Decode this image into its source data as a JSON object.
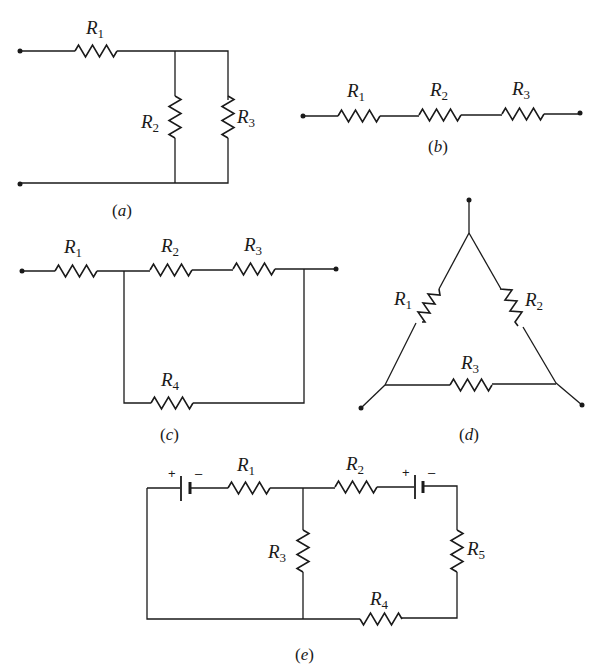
{
  "figure": {
    "circuits": [
      {
        "id": "a",
        "caption_letter": "a",
        "topology": "R1 in series with parallel combination of R2 and R3",
        "resistors": [
          {
            "name": "R",
            "sub": "1"
          },
          {
            "name": "R",
            "sub": "2"
          },
          {
            "name": "R",
            "sub": "3"
          }
        ]
      },
      {
        "id": "b",
        "caption_letter": "b",
        "topology": "R1, R2, R3 in series",
        "resistors": [
          {
            "name": "R",
            "sub": "1"
          },
          {
            "name": "R",
            "sub": "2"
          },
          {
            "name": "R",
            "sub": "3"
          }
        ]
      },
      {
        "id": "c",
        "caption_letter": "c",
        "topology": "R1 in series with (R2+R3 series) parallel to R4",
        "resistors": [
          {
            "name": "R",
            "sub": "1"
          },
          {
            "name": "R",
            "sub": "2"
          },
          {
            "name": "R",
            "sub": "3"
          },
          {
            "name": "R",
            "sub": "4"
          }
        ]
      },
      {
        "id": "d",
        "caption_letter": "d",
        "topology": "Delta (triangle) network of R1, R2, R3",
        "resistors": [
          {
            "name": "R",
            "sub": "1"
          },
          {
            "name": "R",
            "sub": "2"
          },
          {
            "name": "R",
            "sub": "3"
          }
        ]
      },
      {
        "id": "e",
        "caption_letter": "e",
        "topology": "Two-loop circuit with two batteries and R1-R5",
        "resistors": [
          {
            "name": "R",
            "sub": "1"
          },
          {
            "name": "R",
            "sub": "2"
          },
          {
            "name": "R",
            "sub": "3"
          },
          {
            "name": "R",
            "sub": "4"
          },
          {
            "name": "R",
            "sub": "5"
          }
        ],
        "batteries": [
          {
            "plus": "+",
            "minus": "–"
          },
          {
            "plus": "+",
            "minus": "–"
          }
        ]
      }
    ],
    "caption_open": "(",
    "caption_close": ")"
  }
}
